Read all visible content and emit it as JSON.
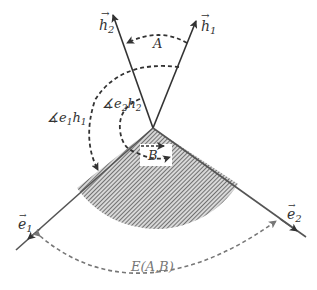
{
  "diagram": {
    "type": "vector-angle-diagram",
    "vectors": {
      "h2": {
        "label": "h",
        "subscript": "2",
        "tip": [
          113,
          14
        ]
      },
      "h1": {
        "label": "h",
        "subscript": "1",
        "tip": [
          197,
          20
        ]
      },
      "e1": {
        "label": "e",
        "subscript": "1",
        "tip": [
          16,
          250
        ]
      },
      "e2": {
        "label": "e",
        "subscript": "2",
        "tip": [
          306,
          237
        ]
      }
    },
    "origin": [
      153,
      128
    ],
    "angles": {
      "A": {
        "label": "A"
      },
      "B": {
        "label": "B"
      },
      "e1h1": {
        "prefix": "∡",
        "v1": "e",
        "s1": "1",
        "v2": "h",
        "s2": "1"
      },
      "e2h2": {
        "prefix": "∡",
        "v1": "e",
        "s1": "2",
        "v2": "h",
        "s2": "2"
      },
      "E": {
        "label": "E(A,B)"
      }
    },
    "colors": {
      "stroke": "#333333",
      "hatch": "#444444",
      "dashed_gray": "#777777"
    }
  }
}
